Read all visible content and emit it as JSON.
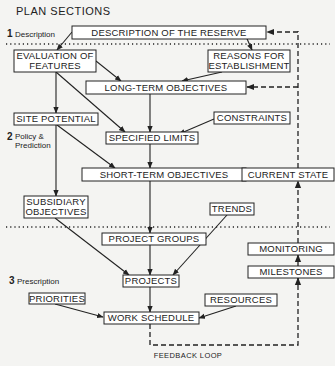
{
  "title": "PLAN SECTIONS",
  "sections": [
    {
      "number": "1",
      "label": "Description"
    },
    {
      "number": "2",
      "label_line1": "Policy &",
      "label_line2": "Prediction"
    },
    {
      "number": "3",
      "label": "Prescription"
    }
  ],
  "nodes": {
    "description": {
      "label": "DESCRIPTION OF THE RESERVE"
    },
    "evaluation": {
      "line1": "EVALUATION OF",
      "line2": "FEATURES"
    },
    "reasons": {
      "line1": "REASONS FOR",
      "line2": "ESTABLISHMENT"
    },
    "long_term": {
      "label": "LONG-TERM OBJECTIVES"
    },
    "site_potential": {
      "label": "SITE POTENTIAL"
    },
    "constraints": {
      "label": "CONSTRAINTS"
    },
    "specified_limits": {
      "label": "SPECIFIED LIMITS"
    },
    "short_term": {
      "label": "SHORT-TERM OBJECTIVES"
    },
    "current_state": {
      "label": "CURRENT STATE"
    },
    "subsidiary": {
      "line1": "SUBSIDIARY",
      "line2": "OBJECTIVES"
    },
    "trends": {
      "label": "TRENDS"
    },
    "project_groups": {
      "label": "PROJECT GROUPS"
    },
    "monitoring": {
      "label": "MONITORING"
    },
    "projects": {
      "label": "PROJECTS"
    },
    "milestones": {
      "label": "MILESTONES"
    },
    "priorities": {
      "label": "PRIORITIES"
    },
    "resources": {
      "label": "RESOURCES"
    },
    "work_schedule": {
      "label": "WORK SCHEDULE"
    }
  },
  "feedback_loop": {
    "label": "FEEDBACK LOOP"
  },
  "edges": [
    {
      "from": "description",
      "to": "evaluation",
      "style": "solid"
    },
    {
      "from": "description",
      "to": "reasons",
      "style": "solid"
    },
    {
      "from": "evaluation",
      "to": "long_term",
      "style": "solid"
    },
    {
      "from": "reasons",
      "to": "long_term",
      "style": "solid"
    },
    {
      "from": "evaluation",
      "to": "site_potential",
      "style": "solid"
    },
    {
      "from": "evaluation",
      "to": "specified_limits",
      "style": "solid"
    },
    {
      "from": "long_term",
      "to": "specified_limits",
      "style": "solid"
    },
    {
      "from": "constraints",
      "to": "specified_limits",
      "style": "solid"
    },
    {
      "from": "site_potential",
      "to": "short_term",
      "style": "solid"
    },
    {
      "from": "specified_limits",
      "to": "short_term",
      "style": "solid"
    },
    {
      "from": "current_state",
      "to": "short_term",
      "style": "dashed"
    },
    {
      "from": "site_potential",
      "to": "subsidiary",
      "style": "solid"
    },
    {
      "from": "short_term",
      "to": "project_groups",
      "style": "solid"
    },
    {
      "from": "subsidiary",
      "to": "projects",
      "style": "solid"
    },
    {
      "from": "project_groups",
      "to": "projects",
      "style": "solid"
    },
    {
      "from": "trends",
      "to": "projects",
      "style": "solid"
    },
    {
      "from": "projects",
      "to": "work_schedule",
      "style": "solid"
    },
    {
      "from": "priorities",
      "to": "work_schedule",
      "style": "solid"
    },
    {
      "from": "resources",
      "to": "work_schedule",
      "style": "solid"
    },
    {
      "from": "work_schedule",
      "to": "milestones",
      "style": "dashed",
      "label": "FEEDBACK LOOP"
    },
    {
      "from": "milestones",
      "to": "monitoring",
      "style": "dashed"
    },
    {
      "from": "monitoring",
      "to": "current_state",
      "style": "dashed"
    },
    {
      "from": "current_state",
      "to": "long_term",
      "style": "dashed"
    },
    {
      "from": "long_term",
      "to": "description",
      "style": "dashed"
    }
  ]
}
